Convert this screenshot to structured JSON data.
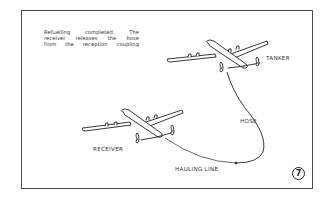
{
  "figure": {
    "number": "7",
    "caption_lines": [
      "Refuelling completed. The",
      "receiver releases the hose",
      "from the reception coupling"
    ],
    "labels": {
      "tanker": "TANKER",
      "receiver": "RECEIVER",
      "hose": "HOSE",
      "hauling_line": "HAULING LINE"
    },
    "colors": {
      "line": "#222222",
      "frame": "#4a4a4a",
      "background": "#ffffff"
    }
  }
}
